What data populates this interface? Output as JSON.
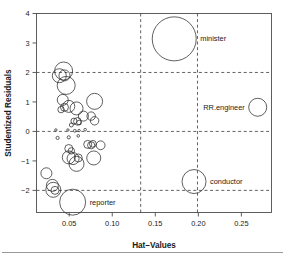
{
  "figure": {
    "name": "influence-plot",
    "background": "#ffffff",
    "footer_rule_color": "#9a9a9a"
  },
  "chart_data": {
    "type": "scatter",
    "title": "",
    "xlabel": "Hat–Values",
    "ylabel": "Studentized Residuals",
    "xlim": [
      0.012,
      0.285
    ],
    "ylim": [
      -2.75,
      4.0
    ],
    "xticks": [
      0.05,
      0.1,
      0.15,
      0.2,
      0.25
    ],
    "xtick_labels": [
      "0.05",
      "0.10",
      "0.15",
      "0.20",
      "0.25"
    ],
    "yticks": [
      -2,
      -1,
      0,
      1,
      2,
      3,
      4
    ],
    "ytick_labels": [
      "−2",
      "−1",
      "0",
      "1",
      "2",
      "3",
      "4"
    ],
    "grid": false,
    "legend": "none",
    "marker": "open-circle",
    "marker_color": "#2b2b2b",
    "size_encoding": "Cook's distance",
    "reference_lines": {
      "horizontal": [
        -2,
        0,
        2
      ],
      "vertical": [
        0.133,
        0.199
      ],
      "style": "dashed"
    },
    "annotations": [
      {
        "label": "minister",
        "x": 0.172,
        "y": 3.14
      },
      {
        "label": "RR.engineer",
        "x": 0.269,
        "y": 0.82
      },
      {
        "label": "conductor",
        "x": 0.195,
        "y": -1.7
      },
      {
        "label": "reporter",
        "x": 0.054,
        "y": -2.4
      }
    ],
    "points": [
      {
        "x": 0.172,
        "y": 3.14,
        "r": 22.0,
        "label": "minister"
      },
      {
        "x": 0.269,
        "y": 0.82,
        "r": 9.0,
        "label": "RR.engineer"
      },
      {
        "x": 0.195,
        "y": -1.7,
        "r": 12.0,
        "label": "conductor"
      },
      {
        "x": 0.054,
        "y": -2.4,
        "r": 13.0,
        "label": "reporter"
      },
      {
        "x": 0.0435,
        "y": 2.05,
        "r": 9.0,
        "label": ""
      },
      {
        "x": 0.0385,
        "y": 1.89,
        "r": 7.0,
        "label": ""
      },
      {
        "x": 0.0445,
        "y": 1.9,
        "r": 5.5,
        "label": ""
      },
      {
        "x": 0.0465,
        "y": 1.56,
        "r": 9.0,
        "label": ""
      },
      {
        "x": 0.0425,
        "y": 1.07,
        "r": 5.5,
        "label": ""
      },
      {
        "x": 0.0405,
        "y": 0.74,
        "r": 3.2,
        "label": ""
      },
      {
        "x": 0.0445,
        "y": 0.82,
        "r": 4.0,
        "label": ""
      },
      {
        "x": 0.0495,
        "y": 0.85,
        "r": 6.0,
        "label": ""
      },
      {
        "x": 0.0585,
        "y": 0.78,
        "r": 6.5,
        "label": ""
      },
      {
        "x": 0.0795,
        "y": 1.02,
        "r": 8.0,
        "label": ""
      },
      {
        "x": 0.0665,
        "y": 0.52,
        "r": 5.0,
        "label": ""
      },
      {
        "x": 0.0755,
        "y": 0.52,
        "r": 4.2,
        "label": ""
      },
      {
        "x": 0.0795,
        "y": 0.36,
        "r": 4.2,
        "label": ""
      },
      {
        "x": 0.0555,
        "y": 0.35,
        "r": 3.0,
        "label": ""
      },
      {
        "x": 0.0595,
        "y": 0.34,
        "r": 3.8,
        "label": ""
      },
      {
        "x": 0.0525,
        "y": 0.22,
        "r": 2.0,
        "label": ""
      },
      {
        "x": 0.0615,
        "y": 0.3,
        "r": 2.4,
        "label": ""
      },
      {
        "x": 0.0345,
        "y": 0.05,
        "r": 1.2,
        "label": ""
      },
      {
        "x": 0.0485,
        "y": 0.05,
        "r": 1.2,
        "label": ""
      },
      {
        "x": 0.0565,
        "y": 0.02,
        "r": 1.4,
        "label": ""
      },
      {
        "x": 0.0615,
        "y": 0.03,
        "r": 1.2,
        "label": ""
      },
      {
        "x": 0.0685,
        "y": 0.06,
        "r": 1.3,
        "label": ""
      },
      {
        "x": 0.0365,
        "y": -0.22,
        "r": 1.6,
        "label": ""
      },
      {
        "x": 0.0495,
        "y": -0.2,
        "r": 1.6,
        "label": ""
      },
      {
        "x": 0.0605,
        "y": -0.15,
        "r": 1.3,
        "label": ""
      },
      {
        "x": 0.0715,
        "y": -0.44,
        "r": 4.0,
        "label": ""
      },
      {
        "x": 0.0755,
        "y": -0.47,
        "r": 3.6,
        "label": ""
      },
      {
        "x": 0.0775,
        "y": -0.42,
        "r": 3.4,
        "label": ""
      },
      {
        "x": 0.0865,
        "y": -0.47,
        "r": 4.4,
        "label": ""
      },
      {
        "x": 0.0495,
        "y": -0.58,
        "r": 4.0,
        "label": ""
      },
      {
        "x": 0.0525,
        "y": -0.66,
        "r": 3.2,
        "label": ""
      },
      {
        "x": 0.0495,
        "y": -0.88,
        "r": 6.5,
        "label": ""
      },
      {
        "x": 0.0545,
        "y": -0.92,
        "r": 6.0,
        "label": ""
      },
      {
        "x": 0.0585,
        "y": -1.1,
        "r": 7.5,
        "label": ""
      },
      {
        "x": 0.0605,
        "y": -0.9,
        "r": 4.0,
        "label": ""
      },
      {
        "x": 0.0785,
        "y": -0.9,
        "r": 7.0,
        "label": ""
      },
      {
        "x": 0.0235,
        "y": -1.42,
        "r": 5.5,
        "label": ""
      },
      {
        "x": 0.0305,
        "y": -1.83,
        "r": 6.0,
        "label": ""
      },
      {
        "x": 0.0315,
        "y": -1.98,
        "r": 7.5,
        "label": ""
      },
      {
        "x": 0.0335,
        "y": -2.0,
        "r": 4.0,
        "label": ""
      }
    ]
  }
}
